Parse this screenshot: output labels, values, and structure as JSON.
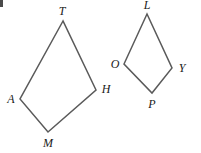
{
  "figure": {
    "width": 201,
    "height": 153,
    "background_color": "#ffffff",
    "stroke_color": "#5a5a5a",
    "stroke_width": 1.5,
    "label_color": "#1a1a1a",
    "corner_mark": {
      "name": "corner-artifact",
      "color": "#4a4a4a"
    },
    "shapes": [
      {
        "name": "quadrilateral-tamh",
        "label": "TAMH",
        "path": "63,21 20,99 48,132 96,90",
        "vertices": [
          {
            "label": "T",
            "x": 63,
            "y": 21,
            "label_x": 62,
            "label_y": 11
          },
          {
            "label": "A",
            "x": 20,
            "y": 99,
            "label_x": 11,
            "label_y": 99
          },
          {
            "label": "M",
            "x": 48,
            "y": 132,
            "label_x": 48,
            "label_y": 143
          },
          {
            "label": "H",
            "x": 96,
            "y": 90,
            "label_x": 106,
            "label_y": 89
          }
        ]
      },
      {
        "name": "quadrilateral-lopy",
        "label": "LOPY",
        "path": "147,14 124,64 152,93 172,68",
        "vertices": [
          {
            "label": "L",
            "x": 147,
            "y": 14,
            "label_x": 147,
            "label_y": 5
          },
          {
            "label": "O",
            "x": 124,
            "y": 64,
            "label_x": 115,
            "label_y": 64
          },
          {
            "label": "P",
            "x": 152,
            "y": 93,
            "label_x": 152,
            "label_y": 104
          },
          {
            "label": "Y",
            "x": 172,
            "y": 68,
            "label_x": 182,
            "label_y": 68
          }
        ]
      }
    ]
  }
}
